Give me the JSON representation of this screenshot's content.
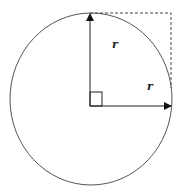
{
  "diagram": {
    "labels": {
      "radius_vertical": "r",
      "radius_horizontal": "r"
    },
    "colors": {
      "stroke": "#333333",
      "dashed": "#444444",
      "background": "#ffffff"
    }
  }
}
